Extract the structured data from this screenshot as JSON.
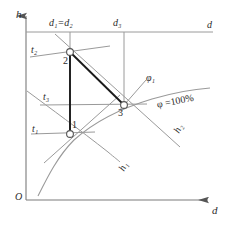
{
  "diagram": {
    "axes": {
      "y_axis_label": "h",
      "x_axis_label": "d",
      "origin_label": "O",
      "top_line_label": "d"
    },
    "vertical_lines": [
      {
        "name": "d1-d2",
        "label": "d₁=d₂",
        "label_parts": {
          "base1": "d",
          "sub1": "1",
          "eq": "=",
          "base2": "d",
          "sub2": "2"
        },
        "x": 70
      },
      {
        "name": "d3",
        "label": "d₃",
        "label_parts": {
          "base1": "d",
          "sub1": "3"
        },
        "x": 124
      }
    ],
    "points": [
      {
        "id": "1",
        "label": "1",
        "x": 70,
        "y": 134
      },
      {
        "id": "2",
        "label": "2",
        "x": 70,
        "y": 52
      },
      {
        "id": "3",
        "label": "3",
        "x": 124,
        "y": 105
      }
    ],
    "isotherms": [
      {
        "name": "t1",
        "label": "t₁",
        "base": "t",
        "sub": "1",
        "label_x": 32,
        "label_y": 124
      },
      {
        "name": "t2",
        "label": "t₂",
        "base": "t",
        "sub": "2",
        "label_x": 31,
        "label_y": 46
      },
      {
        "name": "t3",
        "label": "t₃",
        "base": "t",
        "sub": "3",
        "label_x": 43,
        "label_y": 93
      }
    ],
    "enthalpy_lines": [
      {
        "name": "h1",
        "label": "h₁",
        "base": "h",
        "sub": "1",
        "label_x": 117,
        "label_y": 168
      },
      {
        "name": "h2",
        "label": "h₂",
        "base": "h",
        "sub": "2",
        "label_x": 172,
        "label_y": 130
      }
    ],
    "humidity_lines": [
      {
        "name": "phi1",
        "label": "φ₁",
        "base": "φ",
        "sub": "1",
        "label_x": 147,
        "label_y": 76
      },
      {
        "name": "phi-100",
        "label": "φ =100%",
        "label_x": 157,
        "label_y": 100
      }
    ],
    "process_path": {
      "name": "1-2-3",
      "segments": [
        "1→2",
        "2→3"
      ]
    },
    "colors": {
      "background": "#ffffff",
      "grid_line": "#8c8c8c",
      "curve": "#8c8c8c",
      "process_line": "#1a1a1a",
      "axis": "#7a7a7a",
      "text": "#2b2b2b"
    }
  }
}
